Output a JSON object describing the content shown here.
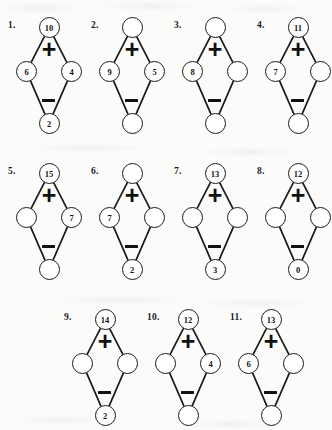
{
  "worksheet": {
    "operator_top": "+",
    "operator_bottom": "−",
    "node_roles": [
      "top",
      "left",
      "right",
      "bottom"
    ],
    "empty_value": ""
  },
  "rows": [
    {
      "name": "row-1",
      "top": 14,
      "left_offset": 6,
      "puzzles": [
        {
          "index": "1.",
          "top": "10",
          "left": "6",
          "right": "4",
          "bottom": "2"
        },
        {
          "index": "2.",
          "top": "",
          "left": "9",
          "right": "5",
          "bottom": ""
        },
        {
          "index": "3.",
          "top": "",
          "left": "8",
          "right": "",
          "bottom": ""
        },
        {
          "index": "4.",
          "top": "11",
          "left": "7",
          "right": "",
          "bottom": ""
        }
      ]
    },
    {
      "name": "row-2",
      "top": 160,
      "left_offset": 6,
      "puzzles": [
        {
          "index": "5.",
          "top": "15",
          "left": "",
          "right": "7",
          "bottom": ""
        },
        {
          "index": "6.",
          "top": "",
          "left": "7",
          "right": "",
          "bottom": "2"
        },
        {
          "index": "7.",
          "top": "13",
          "left": "",
          "right": "",
          "bottom": "3"
        },
        {
          "index": "8.",
          "top": "12",
          "left": "",
          "right": "",
          "bottom": "0"
        }
      ]
    },
    {
      "name": "row-3",
      "top": 306,
      "left_offset": 62,
      "puzzles": [
        {
          "index": "9.",
          "top": "14",
          "left": "",
          "right": "",
          "bottom": "2"
        },
        {
          "index": "10.",
          "top": "12",
          "left": "",
          "right": "4",
          "bottom": ""
        },
        {
          "index": "11.",
          "top": "13",
          "left": "6",
          "right": "",
          "bottom": ""
        }
      ]
    }
  ]
}
